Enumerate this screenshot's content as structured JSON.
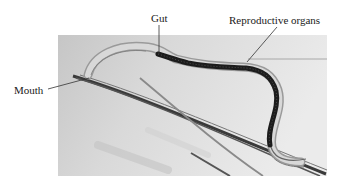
{
  "figure": {
    "labels": {
      "gut": "Gut",
      "reproductive_organs": "Reproductive organs",
      "mouth": "Mouth"
    },
    "colors": {
      "background": "#ffffff",
      "photo_bg": "#dcdcdc",
      "worm_dark": "#1c1c1c",
      "leader_line": "#333333",
      "label_text": "#1a1a1a"
    }
  }
}
